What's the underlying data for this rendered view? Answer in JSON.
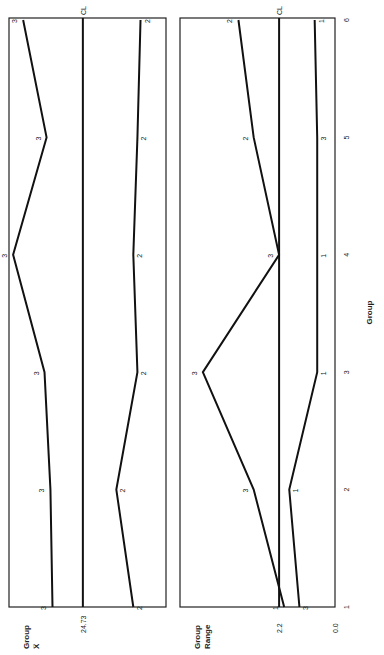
{
  "chart_data": [
    {
      "type": "line",
      "title": "",
      "ylabel": "Group X̅",
      "ylabel_lines": [
        "Group",
        "X̅"
      ],
      "xlabel": "",
      "x": [
        1,
        2,
        3,
        4,
        5,
        6
      ],
      "center_line": {
        "label": "CL",
        "value": 24.73,
        "value_label": "24.73"
      },
      "series": [
        {
          "name": "max",
          "point_labels": [
            "3",
            "3",
            "3",
            "3",
            "3",
            "3"
          ],
          "values": [
            25.91,
            25.99,
            26.22,
            27.44,
            26.14,
            27.05
          ]
        },
        {
          "name": "min",
          "point_labels": [
            "2",
            "2",
            "2",
            "2",
            "2",
            "2"
          ],
          "values": [
            22.77,
            23.43,
            22.61,
            22.77,
            22.61,
            22.49
          ]
        }
      ],
      "ylim": [
        21.5,
        27.6
      ],
      "orientation": "rotated 90 degrees counterclockwise"
    },
    {
      "type": "line",
      "title": "",
      "ylabel": "Group Range",
      "ylabel_lines": [
        "Group",
        "Range"
      ],
      "xlabel": "Group",
      "x": [
        1,
        2,
        3,
        4,
        5,
        6
      ],
      "x_tick_labels": [
        "1",
        "2",
        "3",
        "4",
        "5",
        "6"
      ],
      "center_line": {
        "label": "CL",
        "value": 2.2,
        "value_label": "2.2"
      },
      "y_tick_labels": [
        "0.0",
        "2.2"
      ],
      "series": [
        {
          "name": "max",
          "point_labels": [
            "1",
            "3",
            "3",
            "3",
            "2",
            "2"
          ],
          "values": [
            2.0,
            3.2,
            5.2,
            2.2,
            3.2,
            3.8
          ]
        },
        {
          "name": "min",
          "point_labels": [
            "3",
            "1",
            "1",
            "1",
            "3",
            "1"
          ],
          "values": [
            1.4,
            1.8,
            0.7,
            0.7,
            0.7,
            0.8
          ]
        }
      ],
      "ylim": [
        0.0,
        6.1
      ],
      "orientation": "rotated 90 degrees counterclockwise"
    }
  ]
}
